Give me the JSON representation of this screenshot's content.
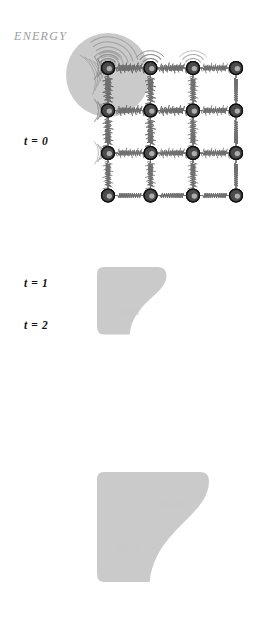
{
  "figure": {
    "type": "diagram",
    "width": 254,
    "height": 623,
    "background": "#ffffff"
  },
  "colors": {
    "node_fill": "#4a4a4a",
    "node_edge": "#111111",
    "node_highlight": "#cfcfcf",
    "spring": "#6f6f6f",
    "blob": "#b6b6b6",
    "blob_opacity": 0.72,
    "wave_arc": "#8c8c8c",
    "energy_text": "#9b9b9b",
    "heat_text": "#c9c9c9",
    "time_text": "#111111"
  },
  "lattice": {
    "columns": 4,
    "rows": 4,
    "col_x": [
      108,
      150.5,
      193,
      236
    ],
    "row_y": [
      68,
      110.5,
      153,
      195.5
    ],
    "node_radius": 6.4,
    "spring_coils": 11
  },
  "panels": [
    {
      "id": "t0",
      "time_label": "t = 0",
      "time_label_x": 24,
      "time_label_y": 135,
      "callout": {
        "text": "ENERGY",
        "x": 14,
        "y": 29
      },
      "blob": {
        "shape": "circle",
        "cx": 108,
        "cy": 75,
        "r": 42
      },
      "heat_labels": [],
      "excited_nodes": [
        [
          0,
          0
        ]
      ],
      "wave_nodes": [],
      "side_wave_nodes": [],
      "vibrating_springs": [],
      "rows_visible": 4
    },
    {
      "id": "t1",
      "time_label": "t = 1",
      "time_label_x": 24,
      "time_label_y": 277,
      "callout": null,
      "blob": {
        "shape": "quarter-lobe",
        "cols": 2,
        "rows": 2
      },
      "heat_labels": [
        {
          "text": "HEAT",
          "x": 129,
          "y": 105
        }
      ],
      "excited_nodes": [
        [
          0,
          0
        ],
        [
          1,
          0
        ],
        [
          0,
          1
        ],
        [
          1,
          1
        ]
      ],
      "wave_nodes": [
        [
          0,
          0
        ],
        [
          1,
          0
        ]
      ],
      "side_wave_nodes": [
        [
          0,
          0
        ],
        [
          0,
          1
        ]
      ],
      "rows_visible": 4
    },
    {
      "id": "t2",
      "time_label": "t = 2",
      "time_label_x": 24,
      "time_label_y": 319,
      "callout": null,
      "blob": {
        "shape": "quarter-lobe",
        "cols": 3,
        "rows": 3
      },
      "heat_labels": [
        {
          "text": "HEAT",
          "x": 172,
          "y": 93
        },
        {
          "text": "HEAT",
          "x": 129,
          "y": 135
        }
      ],
      "excited_nodes": [
        [
          0,
          0
        ],
        [
          1,
          0
        ],
        [
          2,
          0
        ],
        [
          0,
          1
        ],
        [
          1,
          1
        ],
        [
          2,
          1
        ],
        [
          0,
          2
        ],
        [
          1,
          2
        ],
        [
          2,
          2
        ]
      ],
      "wave_nodes": [
        [
          0,
          0
        ],
        [
          1,
          0
        ],
        [
          2,
          0
        ]
      ],
      "side_wave_nodes": [
        [
          0,
          0
        ],
        [
          0,
          1
        ],
        [
          0,
          2
        ]
      ],
      "rows_visible": 4
    }
  ],
  "panel_offsets": {
    "t0": 0,
    "t1": 210,
    "t2": 415
  }
}
